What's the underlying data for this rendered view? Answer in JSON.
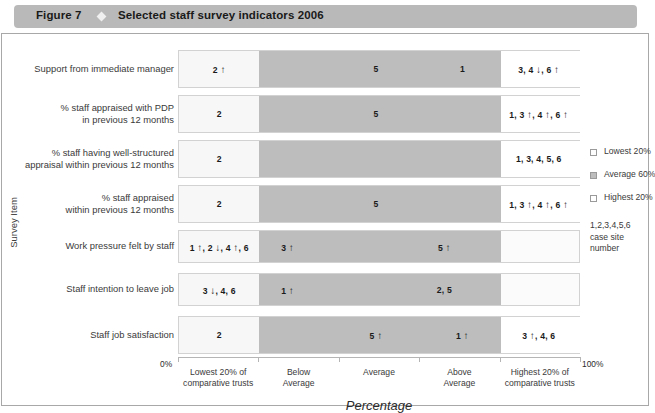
{
  "figure": {
    "label": "Figure 7",
    "diamond_icon": "diamond-bullet-icon",
    "title": "Selected staff survey indicators 2006"
  },
  "axes": {
    "y_title": "Survey Item",
    "x_title": "Percentage",
    "x_start_label": "0%",
    "x_end_label": "100%",
    "categories": [
      "Lowest 20% of\ncomparative trusts",
      "Below\nAverage",
      "Average",
      "Above\nAverage",
      "Highest 20% of\ncomparative trusts"
    ]
  },
  "legend": {
    "items": [
      {
        "swatch": "lowest-swatch",
        "label": "Lowest 20%"
      },
      {
        "swatch": "average-swatch",
        "label": "Average 60%"
      },
      {
        "swatch": "highest-swatch",
        "label": "Highest 20%"
      }
    ],
    "note_line1": "1,2,3,4,5,6",
    "note_line2": "case site number"
  },
  "colors": {
    "title_bar": "#b9b9b9",
    "lowest": "#f7f7f7",
    "average": "#bdbdbd",
    "highest": "#ffffff",
    "frame_border": "#a8a8a8"
  },
  "chart_data": {
    "type": "bar",
    "title": "Selected staff survey indicators 2006",
    "xlabel": "Percentage",
    "ylabel": "Survey Item",
    "xlim": [
      0,
      100
    ],
    "grid": false,
    "legend_position": "right",
    "band_breaks_pct": [
      0,
      20,
      80,
      100
    ],
    "categories": [
      "Support from immediate manager",
      "% staff appraised with PDP in previous 12 months",
      "% staff having well-structured appraisal within previous 12 months",
      "% staff appraised within previous 12 months",
      "Work pressure felt by staff",
      "Staff intention to leave job",
      "Staff job satisfaction"
    ],
    "rows": [
      {
        "label_lines": [
          "Support from immediate manager"
        ],
        "bar_end_pct": 100,
        "markers": [
          {
            "text": "2 ↑",
            "pos_pct": 10.0
          },
          {
            "text": "5",
            "pos_pct": 49.0
          },
          {
            "text": "1",
            "pos_pct": 70.5
          },
          {
            "text": "3, 4 ↓, 6 ↑",
            "pos_pct": 89.5
          }
        ]
      },
      {
        "label_lines": [
          "% staff appraised with PDP",
          "in previous 12 months"
        ],
        "bar_end_pct": 100,
        "markers": [
          {
            "text": "2",
            "pos_pct": 10.0
          },
          {
            "text": "5",
            "pos_pct": 49.0
          },
          {
            "text": "1, 3 ↑, 4 ↑, 6 ↑",
            "pos_pct": 89.5
          }
        ]
      },
      {
        "label_lines": [
          "% staff having well-structured",
          "appraisal within previous 12 months"
        ],
        "bar_end_pct": 100,
        "markers": [
          {
            "text": "2",
            "pos_pct": 10.0
          },
          {
            "text": "1, 3, 4, 5, 6",
            "pos_pct": 89.5
          }
        ]
      },
      {
        "label_lines": [
          "% staff appraised",
          "within previous 12 months"
        ],
        "bar_end_pct": 100,
        "markers": [
          {
            "text": "2",
            "pos_pct": 10.0
          },
          {
            "text": "5",
            "pos_pct": 49.0
          },
          {
            "text": "1, 3 ↑, 4 ↑, 6 ↑",
            "pos_pct": 89.5
          }
        ]
      },
      {
        "label_lines": [
          "Work pressure felt by staff"
        ],
        "bar_end_pct": 80,
        "markers": [
          {
            "text": "1 ↑, 2 ↓, 4 ↑, 6",
            "pos_pct": 10.0
          },
          {
            "text": "3 ↑",
            "pos_pct": 27.0
          },
          {
            "text": "5 ↑",
            "pos_pct": 66.0
          }
        ]
      },
      {
        "label_lines": [
          "Staff intention to leave job"
        ],
        "bar_end_pct": 80,
        "markers": [
          {
            "text": "3 ↓, 4, 6",
            "pos_pct": 10.0
          },
          {
            "text": "1 ↑",
            "pos_pct": 27.0
          },
          {
            "text": "2, 5",
            "pos_pct": 66.0
          }
        ]
      },
      {
        "label_lines": [
          "Staff job satisfaction"
        ],
        "bar_end_pct": 100,
        "markers": [
          {
            "text": "2",
            "pos_pct": 10.0
          },
          {
            "text": "5 ↑",
            "pos_pct": 49.0
          },
          {
            "text": "1 ↑",
            "pos_pct": 70.5
          },
          {
            "text": "3 ↑, 4, 6",
            "pos_pct": 89.5
          }
        ]
      }
    ]
  }
}
